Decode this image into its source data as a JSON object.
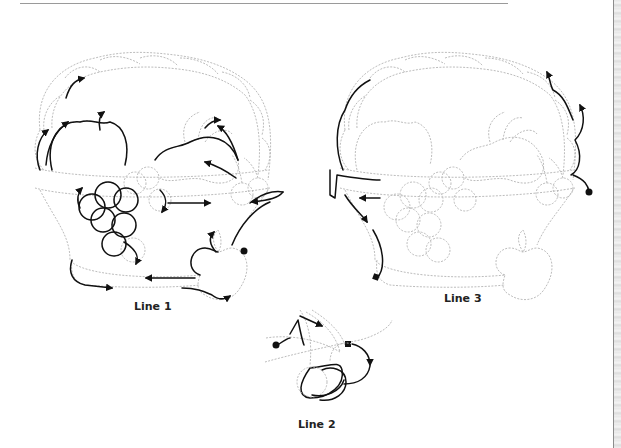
{
  "page": {
    "type": "embroidery stitching-order diagram",
    "colors": {
      "guide_line": "#b4b4b4",
      "trace_line": "#111111",
      "background": "#ffffff",
      "rule": "#9a9a9a"
    }
  },
  "figures": [
    {
      "id": "line1",
      "caption": "Line 1",
      "description": "Full basket with fruits; traced path over apples, grapes, pear, cherries and basket band",
      "start_marker": "dot",
      "end_marker": "none"
    },
    {
      "id": "line2",
      "caption": "Line 2",
      "description": "Cherry pair with stems; traced path around cherries",
      "start_marker": "dot",
      "end_marker": "square"
    },
    {
      "id": "line3",
      "caption": "Line 3",
      "description": "Full basket outline; traced path along basket handle right side and left band",
      "start_marker": "dot",
      "end_marker": "square"
    }
  ],
  "legend": {
    "start_symbol": "filled circle",
    "end_symbol": "filled square",
    "direction_symbol": "arrowhead"
  }
}
